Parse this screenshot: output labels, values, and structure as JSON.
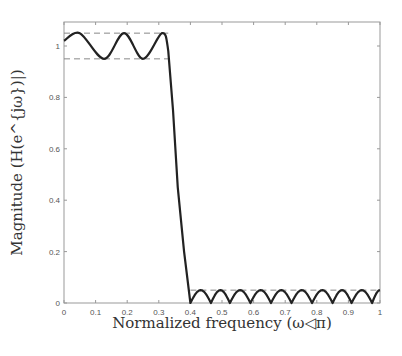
{
  "chart_data": {
    "type": "line",
    "title": "",
    "xlabel": "Normalized frequency (ω◁π)",
    "ylabel": "Magnitude (H(e^{jω})|)",
    "xlim": [
      0,
      1
    ],
    "ylim": [
      0,
      1.09
    ],
    "grid": false,
    "legend": null,
    "x_ticks": [
      0,
      0.1,
      0.2,
      0.3,
      0.4,
      0.5,
      0.6,
      0.7,
      0.8,
      0.9,
      1
    ],
    "x_tick_labels": [
      "0",
      "0.1",
      "0.2",
      "0.3",
      "0.4",
      "0.5",
      "0.6",
      "0.7",
      "0.8",
      "0.9",
      "1"
    ],
    "y_ticks": [
      0,
      0.2,
      0.4,
      0.6,
      0.8,
      1
    ],
    "y_tick_labels": [
      "0",
      "0.2",
      "0.4",
      "0.6",
      "0.8",
      "1"
    ],
    "series": [
      {
        "name": "Magnitude response",
        "style": "solid",
        "color": "#222222",
        "x": [
          0,
          0.05,
          0.127,
          0.19,
          0.25,
          0.31,
          0.33,
          0.345,
          0.36,
          0.38,
          0.4,
          0.4325,
          0.465,
          0.495,
          0.525,
          0.5575,
          0.59,
          0.6225,
          0.655,
          0.6875,
          0.72,
          0.7525,
          0.785,
          0.8175,
          0.85,
          0.88,
          0.91,
          0.9425,
          0.975,
          1.0
        ],
        "y": [
          1.02,
          1.05,
          0.95,
          1.05,
          0.95,
          1.05,
          0.98,
          0.75,
          0.45,
          0.2,
          0.0,
          0.05,
          0.0,
          0.05,
          0.0,
          0.05,
          0.0,
          0.05,
          0.0,
          0.05,
          0.0,
          0.05,
          0.0,
          0.05,
          0.0,
          0.05,
          0.0,
          0.05,
          0.0,
          0.05
        ]
      }
    ],
    "reference_lines": [
      {
        "name": "passband upper bound",
        "style": "dashed",
        "y": 1.05,
        "x_range": [
          0,
          0.33
        ]
      },
      {
        "name": "passband lower bound",
        "style": "dashed",
        "y": 0.95,
        "x_range": [
          0,
          0.33
        ]
      },
      {
        "name": "stopband bound",
        "style": "dashed",
        "y": 0.05,
        "x_range": [
          0.4,
          1.0
        ]
      }
    ]
  },
  "plot": {
    "left": 64,
    "right": 380,
    "top": 22,
    "bottom": 303,
    "y_unit_px": 257
  }
}
